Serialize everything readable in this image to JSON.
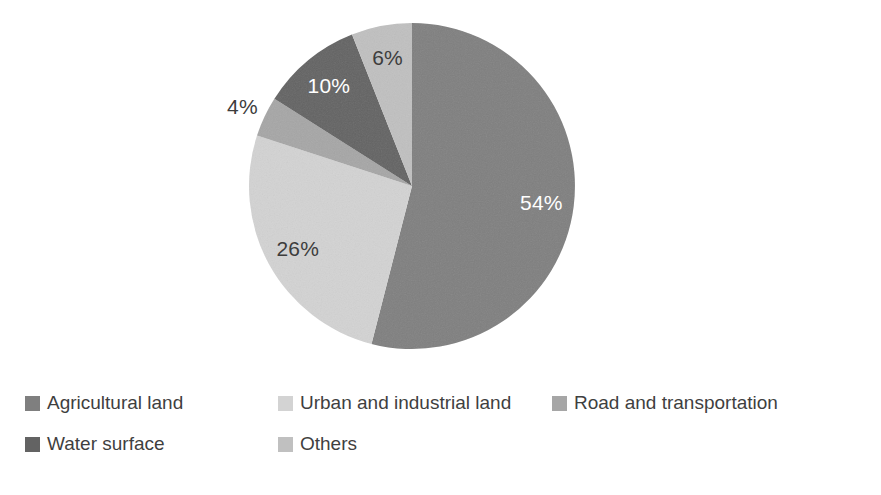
{
  "chart_data": {
    "type": "pie",
    "title": "",
    "unit": "%",
    "direction": "clockwise",
    "start_angle_deg": 0,
    "legend_position": "bottom-left",
    "legend_text_color": "#3f3f3f",
    "background": "#ffffff",
    "categories": [
      "Agricultural land",
      "Urban and industrial land",
      "Road and transportation",
      "Water surface",
      "Others"
    ],
    "values": [
      54,
      26,
      4,
      10,
      6
    ],
    "slices": [
      {
        "label": "Agricultural land",
        "value": 54,
        "display": "54%",
        "color": "#7f7f7f",
        "text_color": "#ffffff",
        "label_inside": true
      },
      {
        "label": "Urban and industrial land",
        "value": 26,
        "display": "26%",
        "color": "#d3d3d3",
        "text_color": "#3d3d3d",
        "label_inside": true
      },
      {
        "label": "Road and transportation",
        "value": 4,
        "display": "4%",
        "color": "#a6a6a6",
        "text_color": "#3d3d3d",
        "label_inside": false
      },
      {
        "label": "Water surface",
        "value": 10,
        "display": "10%",
        "color": "#636363",
        "text_color": "#ffffff",
        "label_inside": true
      },
      {
        "label": "Others",
        "value": 6,
        "display": "6%",
        "color": "#c0c0c0",
        "text_color": "#3d3d3d",
        "label_inside": true
      }
    ]
  }
}
